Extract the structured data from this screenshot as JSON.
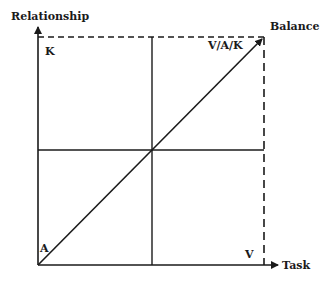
{
  "diagram": {
    "axes": {
      "y_label": "Relationship",
      "x_label": "Task"
    },
    "corner_labels": {
      "top_left": "K",
      "top_right": "V/A/K",
      "bottom_left": "A",
      "bottom_right": "V"
    },
    "diagonal_label": "Balance",
    "colors": {
      "line": "#1a1a1a",
      "background": "#ffffff"
    }
  }
}
